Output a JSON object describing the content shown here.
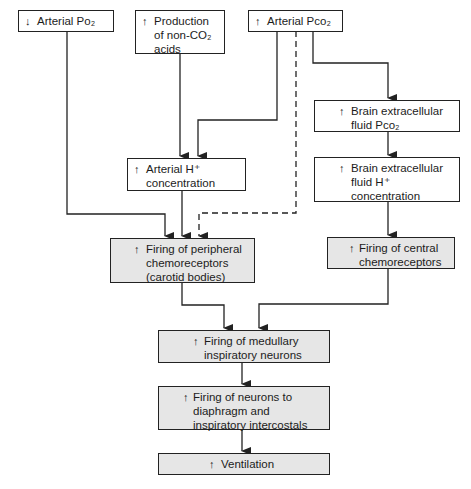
{
  "boxes": {
    "arterial_po2": {
      "arrow": "↓",
      "text": "Arterial Po₂"
    },
    "non_co2_acids": {
      "arrow": "↑",
      "text": "Production\nof non-CO₂\nacids"
    },
    "arterial_pco2": {
      "arrow": "↑",
      "text": "Arterial Pco₂"
    },
    "arterial_h": {
      "arrow": "↑",
      "text": "Arterial H⁺\nconcentration"
    },
    "brain_pco2": {
      "arrow": "↑",
      "text": "Brain extracellular\nfluid Pco₂"
    },
    "brain_h": {
      "arrow": "↑",
      "text": "Brain extracellular\nfluid H⁺\nconcentration"
    },
    "peripheral": {
      "arrow": "↑",
      "text": "Firing of peripheral\nchemoreceptors\n(carotid bodies)"
    },
    "central": {
      "arrow": "↑",
      "text": "Firing of central\nchemoreceptors"
    },
    "medullary": {
      "arrow": "↑",
      "text": "Firing of medullary\ninspiratory neurons"
    },
    "diaphragm": {
      "arrow": "↑",
      "text": "Firing of neurons to\ndiaphragm and\ninspiratory intercostals"
    },
    "ventilation": {
      "arrow": "↑",
      "text": "Ventilation"
    }
  },
  "colors": {
    "shaded_fill": "#e6e6e6",
    "line": "#222222"
  }
}
